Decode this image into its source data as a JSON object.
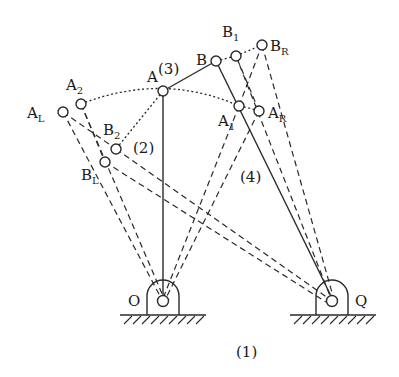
{
  "diagram": {
    "type": "four-bar linkage (crank-rocker) limit positions",
    "links": {
      "ground": "(1)",
      "crank": "(2)",
      "coupler": "(3)",
      "rocker": "(4)"
    },
    "pivots": {
      "O": {
        "label": "O",
        "x": 163,
        "y": 301
      },
      "Q": {
        "label": "Q",
        "x": 332,
        "y": 301
      }
    },
    "joints": {
      "A": {
        "label": "A",
        "sub": "",
        "x": 163,
        "y": 91
      },
      "B": {
        "label": "B",
        "sub": "",
        "x": 216,
        "y": 61
      },
      "A2": {
        "label": "A",
        "sub": "2",
        "x": 81,
        "y": 104
      },
      "AL": {
        "label": "A",
        "sub": "L",
        "x": 63,
        "y": 112
      },
      "A1": {
        "label": "A",
        "sub": "1",
        "x": 239,
        "y": 106
      },
      "AR": {
        "label": "A",
        "sub": "R",
        "x": 259,
        "y": 111
      },
      "B2": {
        "label": "B",
        "sub": "2",
        "x": 116,
        "y": 149
      },
      "BL": {
        "label": "B",
        "sub": "L",
        "x": 105,
        "y": 162
      },
      "B1": {
        "label": "B",
        "sub": "1",
        "x": 236,
        "y": 56
      },
      "BR": {
        "label": "B",
        "sub": "R",
        "x": 262,
        "y": 45
      }
    },
    "labels": {
      "ground": "(1)",
      "crank": "(2)",
      "coupler": "(3)",
      "rocker": "(4)",
      "O": "O",
      "Q": "Q",
      "A": "A",
      "B": "B",
      "A_sym": "A",
      "B_sym": "B",
      "sub_2": "2",
      "sub_L": "L",
      "sub_1": "1",
      "sub_R": "R"
    }
  }
}
